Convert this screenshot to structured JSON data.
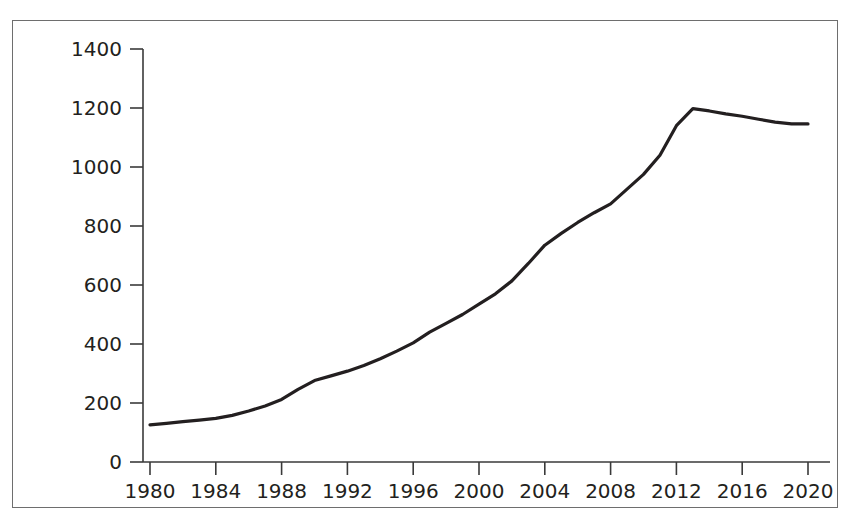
{
  "figure": {
    "background_color": "#ffffff",
    "frame_color": "#6e6e6e",
    "axis_color": "#3a3a3a",
    "line_color": "#231f20",
    "text_color": "#231f20"
  },
  "chart_data": {
    "type": "line",
    "title": "",
    "xlabel": "",
    "ylabel": "No. of companies",
    "xlim": [
      1980,
      2020
    ],
    "ylim": [
      0,
      1400
    ],
    "grid": false,
    "legend": null,
    "x_ticks": [
      1980,
      1984,
      1988,
      1992,
      1996,
      2000,
      2004,
      2008,
      2012,
      2016,
      2020
    ],
    "y_ticks": [
      0,
      200,
      400,
      600,
      800,
      1000,
      1200,
      1400
    ],
    "x_tick_labels": [
      "1980",
      "1984",
      "1988",
      "1992",
      "1996",
      "2000",
      "2004",
      "2008",
      "2012",
      "2016",
      "2020"
    ],
    "y_tick_labels": [
      "0",
      "200",
      "400",
      "600",
      "800",
      "1000",
      "1200",
      "1400"
    ],
    "series": [
      {
        "name": "No. of companies",
        "color": "#231f20",
        "x": [
          1980,
          1981,
          1982,
          1983,
          1984,
          1985,
          1986,
          1987,
          1988,
          1989,
          1990,
          1991,
          1992,
          1993,
          1994,
          1995,
          1996,
          1997,
          1998,
          1999,
          2000,
          2001,
          2002,
          2003,
          2004,
          2005,
          2006,
          2007,
          2008,
          2009,
          2010,
          2011,
          2012,
          2013,
          2014,
          2015,
          2016,
          2017,
          2018,
          2019,
          2020
        ],
        "values": [
          126,
          131,
          137,
          142,
          148,
          158,
          173,
          190,
          212,
          246,
          276,
          292,
          308,
          327,
          350,
          376,
          404,
          440,
          470,
          500,
          535,
          570,
          614,
          673,
          735,
          775,
          812,
          845,
          875,
          925,
          975,
          1040,
          1140,
          1198,
          1190,
          1180,
          1172,
          1162,
          1152,
          1146,
          1146
        ]
      }
    ]
  }
}
